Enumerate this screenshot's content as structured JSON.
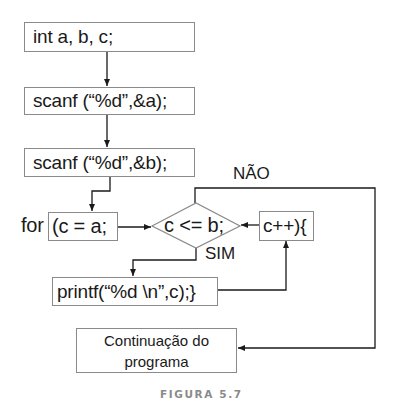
{
  "diagram": {
    "type": "flowchart",
    "nodes": {
      "declare": {
        "text": "int a, b, c;"
      },
      "scan_a": {
        "text": "scanf (“%d”,&a);"
      },
      "scan_b": {
        "text": "scanf (“%d”,&b);"
      },
      "for_keyword": {
        "text": "for"
      },
      "init": {
        "text": "(c = a;"
      },
      "condition": {
        "text": "c <= b;"
      },
      "increment": {
        "text": "c++){"
      },
      "print": {
        "text": "printf(“%d \\n”,c);}"
      },
      "continuation": {
        "line1": "Continuação do",
        "line2": "programa"
      }
    },
    "edge_labels": {
      "no": "NÃO",
      "yes": "SIM"
    },
    "edges": [
      {
        "from": "declare",
        "to": "scan_a"
      },
      {
        "from": "scan_a",
        "to": "scan_b"
      },
      {
        "from": "scan_b",
        "to": "init"
      },
      {
        "from": "init",
        "to": "condition"
      },
      {
        "from": "condition",
        "to": "print",
        "label": "SIM"
      },
      {
        "from": "print",
        "to": "increment"
      },
      {
        "from": "increment",
        "to": "condition"
      },
      {
        "from": "condition",
        "to": "continuation",
        "label": "NÃO"
      }
    ]
  },
  "caption": "FIGURA 5.7",
  "colors": {
    "line": "#1a1a1a",
    "box_border": "#8a8a8a",
    "caption": "#8a8a8a"
  }
}
